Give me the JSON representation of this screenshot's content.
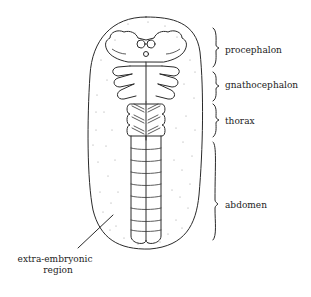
{
  "figure": {
    "regions": [
      {
        "id": "procephalon",
        "label": "procephalon"
      },
      {
        "id": "gnathocephalon",
        "label": "gnathocephalon"
      },
      {
        "id": "thorax",
        "label": "thorax"
      },
      {
        "id": "abdomen",
        "label": "abdomen"
      }
    ],
    "extra_embryonic": {
      "line1": "extra-embryonic",
      "line2": "region"
    },
    "colors": {
      "line": "#2a2a2a",
      "text": "#222222",
      "stipple": "#888888",
      "background": "#ffffff"
    }
  }
}
